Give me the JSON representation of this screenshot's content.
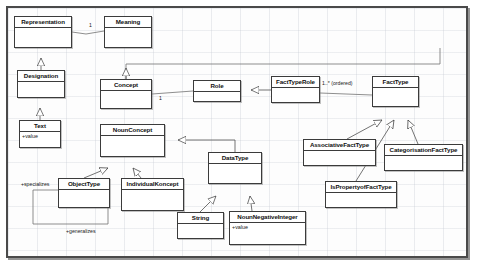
{
  "diagram": {
    "type": "uml-class-diagram",
    "title": "",
    "background": "#fdfdfd",
    "line_color": "#3b3b3b",
    "classes": [
      {
        "id": "representation",
        "name": "Representation",
        "attributes": [],
        "operations": [],
        "x": 14,
        "y": 16,
        "w": 58,
        "h": 32
      },
      {
        "id": "meaning",
        "name": "Meaning",
        "attributes": [],
        "operations": [],
        "x": 104,
        "y": 16,
        "w": 48,
        "h": 32
      },
      {
        "id": "designation",
        "name": "Designation",
        "attributes": [],
        "operations": [],
        "x": 17,
        "y": 70,
        "w": 48,
        "h": 28
      },
      {
        "id": "text",
        "name": "Text",
        "attributes": [
          "+value"
        ],
        "operations": [],
        "x": 19,
        "y": 120,
        "w": 42,
        "h": 28
      },
      {
        "id": "concept",
        "name": "Concept",
        "attributes": [],
        "operations": [],
        "x": 100,
        "y": 79,
        "w": 52,
        "h": 30
      },
      {
        "id": "role",
        "name": "Role",
        "attributes": [],
        "operations": [],
        "x": 193,
        "y": 80,
        "w": 48,
        "h": 22
      },
      {
        "id": "facttyperole",
        "name": "FactTypeRole",
        "attributes": [],
        "operations": [],
        "x": 271,
        "y": 76,
        "w": 49,
        "h": 27
      },
      {
        "id": "facttype",
        "name": "FactType",
        "attributes": [],
        "operations": [],
        "x": 372,
        "y": 76,
        "w": 47,
        "h": 31
      },
      {
        "id": "nounconcept",
        "name": "NounConcept",
        "attributes": [],
        "operations": [],
        "x": 100,
        "y": 124,
        "w": 65,
        "h": 33
      },
      {
        "id": "datatype",
        "name": "DataType",
        "attributes": [],
        "operations": [],
        "x": 208,
        "y": 152,
        "w": 54,
        "h": 32
      },
      {
        "id": "objecttype",
        "name": "ObjectType",
        "attributes": [],
        "operations": [],
        "x": 58,
        "y": 178,
        "w": 52,
        "h": 30
      },
      {
        "id": "individualkoncept",
        "name": "IndividualKoncept",
        "attributes": [],
        "operations": [],
        "x": 121,
        "y": 178,
        "w": 63,
        "h": 33
      },
      {
        "id": "string",
        "name": "String",
        "attributes": [],
        "operations": [],
        "x": 177,
        "y": 212,
        "w": 47,
        "h": 27
      },
      {
        "id": "nounnegativeinteger",
        "name": "NounNegativeInteger",
        "attributes": [
          "+value"
        ],
        "operations": [],
        "x": 229,
        "y": 211,
        "w": 77,
        "h": 34
      },
      {
        "id": "associativefacttype",
        "name": "AssociativeFactType",
        "attributes": [],
        "operations": [],
        "x": 303,
        "y": 139,
        "w": 73,
        "h": 27
      },
      {
        "id": "categorisationfacttype",
        "name": "CategorisationFactType",
        "attributes": [],
        "operations": [],
        "x": 384,
        "y": 144,
        "w": 79,
        "h": 27
      },
      {
        "id": "ispropertyoffacttype",
        "name": "IsPropertyofFactType",
        "attributes": [],
        "operations": [],
        "x": 325,
        "y": 181,
        "w": 72,
        "h": 27
      }
    ],
    "multiplicities": [
      {
        "id": "mult-meaning",
        "label": "1",
        "x": 89,
        "y": 22
      },
      {
        "id": "mult-concept-role",
        "label": "1",
        "x": 159,
        "y": 95
      },
      {
        "id": "mult-facttyperole",
        "label": "1..* (ordered)",
        "x": 322,
        "y": 80
      }
    ],
    "association_labels": [
      {
        "id": "label-specializes",
        "label": "+specializes",
        "x": 21,
        "y": 181
      },
      {
        "id": "label-generalizes",
        "label": "+generalizes",
        "x": 66,
        "y": 228
      }
    ],
    "generalizations": [
      {
        "id": "gen-designation-representation",
        "child": "designation",
        "parent": "representation"
      },
      {
        "id": "gen-text-designation",
        "child": "text",
        "parent": "designation"
      },
      {
        "id": "gen-concept-meaning",
        "child": "concept",
        "parent": "meaning"
      },
      {
        "id": "gen-objecttype-nounconcept",
        "child": "objecttype",
        "parent": "nounconcept"
      },
      {
        "id": "gen-individualkoncept-nounconcept",
        "child": "individualkoncept",
        "parent": "nounconcept"
      },
      {
        "id": "gen-datatype-nounconcept",
        "child": "datatype",
        "parent": "nounconcept"
      },
      {
        "id": "gen-string-datatype",
        "child": "string",
        "parent": "datatype"
      },
      {
        "id": "gen-nounnegativeinteger-datatype",
        "child": "nounnegativeinteger",
        "parent": "datatype"
      },
      {
        "id": "gen-facttyperole-role",
        "child": "facttyperole",
        "parent": "role"
      },
      {
        "id": "gen-associativefacttype-facttype",
        "child": "associativefacttype",
        "parent": "facttype"
      },
      {
        "id": "gen-ispropertyoffacttype-facttype",
        "child": "ispropertyoffacttype",
        "parent": "facttype"
      },
      {
        "id": "gen-categorisationfacttype-facttype",
        "child": "categorisationfacttype",
        "parent": "facttype"
      }
    ],
    "associations": [
      {
        "id": "assoc-representation-meaning",
        "from": "representation",
        "to": "meaning"
      },
      {
        "id": "assoc-concept-role",
        "from": "concept",
        "to": "role"
      },
      {
        "id": "assoc-facttyperole-facttype",
        "from": "facttyperole",
        "to": "facttype"
      },
      {
        "id": "assoc-objecttype-self",
        "from": "objecttype",
        "to": "objecttype"
      }
    ]
  }
}
